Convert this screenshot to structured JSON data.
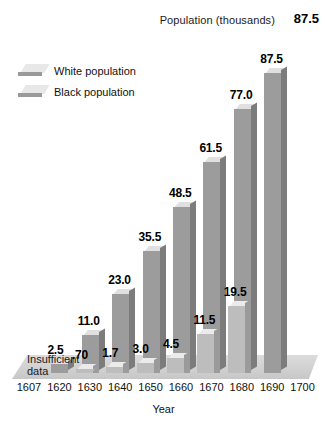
{
  "header": {
    "series_label": "Population (thousands)",
    "highlight_value": "87.5"
  },
  "legend": {
    "items": [
      {
        "label": "White population",
        "swatch": "white-pop-swatch"
      },
      {
        "label": "Black population",
        "swatch": "black-pop-swatch"
      }
    ]
  },
  "annotations": {
    "insufficient_data": "Insufficient data"
  },
  "axis": {
    "x_title": "Year"
  },
  "chart_data": {
    "type": "bar",
    "title": "Population (thousands)",
    "xlabel": "Year",
    "ylabel": "Population (thousands)",
    "ylim": [
      0,
      87.5
    ],
    "grid": false,
    "legend_position": "upper-left",
    "categories": [
      "1607",
      "1620",
      "1630",
      "1640",
      "1650",
      "1660",
      "1670",
      "1680",
      "1690",
      "1700"
    ],
    "series": [
      {
        "name": "White population",
        "values": [
          null,
          2.5,
          11.0,
          23.0,
          35.5,
          48.5,
          61.5,
          77.0,
          87.5,
          null
        ],
        "labels": [
          "",
          "2.5",
          "11.0",
          "23.0",
          "35.5",
          "48.5",
          "61.5",
          "77.0",
          "87.5",
          ""
        ]
      },
      {
        "name": "Black population",
        "values": [
          null,
          null,
          null,
          0.7,
          1.7,
          3.0,
          4.5,
          11.5,
          19.5,
          null
        ],
        "labels": [
          "",
          "",
          "",
          ".70",
          "1.7",
          "3.0",
          "4.5",
          "11.5",
          "19.5",
          ""
        ]
      }
    ],
    "notes": [
      "Insufficient data"
    ],
    "bars": [
      {
        "year": "1607",
        "series": "white",
        "value": null,
        "label": ""
      },
      {
        "year": "1620",
        "series": "white",
        "value": 2.5,
        "label": "2.5"
      },
      {
        "year": "1630",
        "series": "white",
        "value": 11.0,
        "label": "11.0"
      },
      {
        "year": "1640",
        "series": "white",
        "value": 23.0,
        "label": "23.0"
      },
      {
        "year": "1650",
        "series": "white",
        "value": 35.5,
        "label": "35.5"
      },
      {
        "year": "1660",
        "series": "white",
        "value": 48.5,
        "label": "48.5"
      },
      {
        "year": "1670",
        "series": "white",
        "value": 61.5,
        "label": "61.5"
      },
      {
        "year": "1680",
        "series": "white",
        "value": 77.0,
        "label": "77.0"
      },
      {
        "year": "1690",
        "series": "white",
        "value": 87.5,
        "label": "87.5"
      },
      {
        "year": "1630",
        "series": "black",
        "value": 0.7,
        "label": ".70"
      },
      {
        "year": "1640",
        "series": "black",
        "value": 1.7,
        "label": "1.7"
      },
      {
        "year": "1650",
        "series": "black",
        "value": 3.0,
        "label": "3.0"
      },
      {
        "year": "1660",
        "series": "black",
        "value": 4.5,
        "label": "4.5"
      },
      {
        "year": "1670",
        "series": "black",
        "value": 11.5,
        "label": "11.5"
      },
      {
        "year": "1680",
        "series": "black",
        "value": 19.5,
        "label": "19.5"
      }
    ]
  },
  "colors": {
    "bar_front": "#9c9c9c",
    "bar_side": "#7c7c7c",
    "bar_top": "#e0e0e0",
    "black_bar_front": "#bdbdbd",
    "text": "#111111",
    "background": "#ffffff"
  }
}
